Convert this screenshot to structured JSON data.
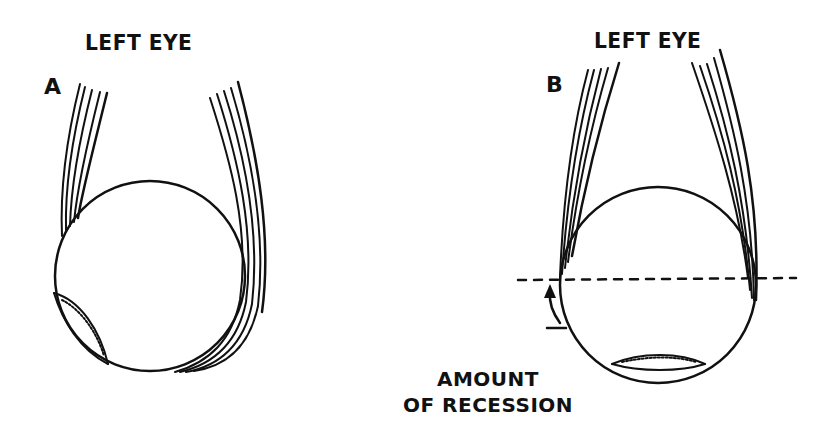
{
  "panels": [
    {
      "id": "A",
      "letter": "A",
      "title": "LEFT EYE"
    },
    {
      "id": "B",
      "letter": "B",
      "title": "LEFT EYE"
    }
  ],
  "annotation": {
    "line1": "AMOUNT",
    "line2": "OF RECESSION"
  },
  "colors": {
    "ink": "#111111",
    "background": "#ffffff"
  }
}
